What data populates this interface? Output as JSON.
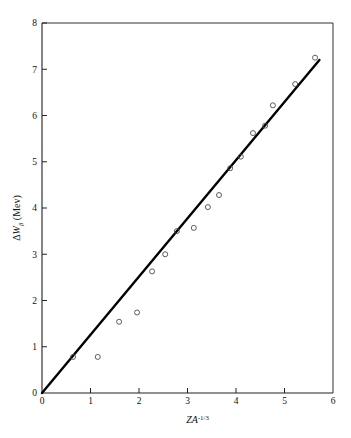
{
  "chart_data": {
    "type": "scatter",
    "title": "",
    "xlabel": "ZA^-1/3",
    "xlabel_parts": {
      "z": "Z",
      "a": "A",
      "exponent": "-1/3"
    },
    "ylabel": "ΔWβ (Mev)",
    "ylabel_parts": {
      "delta": "Δ",
      "w": "W",
      "beta": "β",
      "unit": "(Mev)"
    },
    "xlim": [
      0,
      6
    ],
    "ylim": [
      0,
      8
    ],
    "xticks": [
      "0",
      "1",
      "2",
      "3",
      "4",
      "5",
      "6"
    ],
    "yticks": [
      "0",
      "1",
      "2",
      "3",
      "4",
      "5",
      "6",
      "7",
      "8"
    ],
    "grid": false,
    "legend": null,
    "marker": "open-circle",
    "series": [
      {
        "name": "data",
        "x": [
          0.64,
          1.15,
          1.59,
          1.96,
          2.27,
          2.54,
          2.78,
          3.13,
          3.42,
          3.65,
          3.88,
          4.1,
          4.35,
          4.6,
          4.76,
          5.22,
          5.63
        ],
        "y": [
          0.78,
          0.78,
          1.54,
          1.74,
          2.63,
          3.0,
          3.5,
          3.57,
          4.02,
          4.28,
          4.86,
          5.11,
          5.62,
          5.78,
          6.22,
          6.68,
          7.25
        ]
      }
    ],
    "fit_line": {
      "name": "linear fit",
      "x0": 0.0,
      "y0": 0.0,
      "x1": 5.72,
      "y1": 7.2,
      "slope": 1.259,
      "intercept": 0.0
    }
  },
  "geometry": {
    "plot_left": 42,
    "plot_right": 333,
    "plot_top": 23,
    "plot_bottom": 393
  }
}
